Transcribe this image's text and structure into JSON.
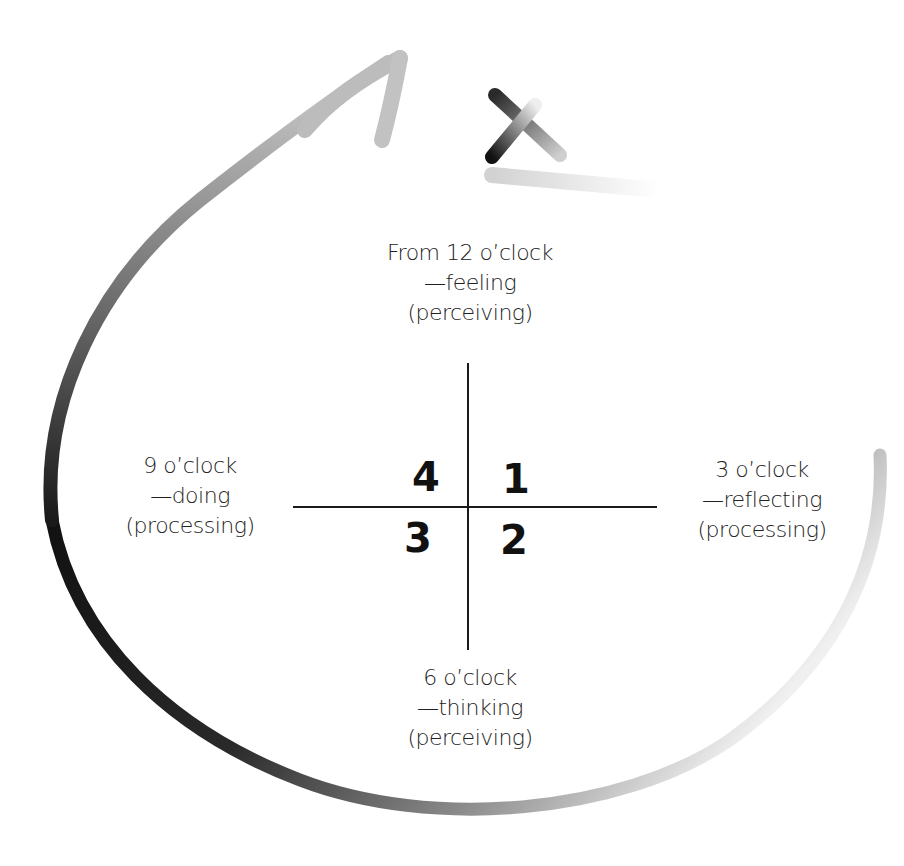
{
  "diagram": {
    "type": "quadrant-cycle",
    "labels": {
      "top": {
        "line1": "From 12 o’clock",
        "line2": "—feeling",
        "line3": "(perceiving)"
      },
      "left": {
        "line1": "9 o’clock",
        "line2": "—doing",
        "line3": "(processing)"
      },
      "right": {
        "line1": "3 o’clock",
        "line2": "—reflecting",
        "line3": "(processing)"
      },
      "bottom": {
        "line1": "6 o’clock",
        "line2": "—thinking",
        "line3": "(perceiving)"
      }
    },
    "quadrants": {
      "top_left": "4",
      "top_right": "1",
      "bottom_right": "2",
      "bottom_left": "3"
    },
    "icons": [
      "loop-arrow-icon",
      "cross-mark-icon"
    ],
    "colors": {
      "stroke_dark": "#111111",
      "stroke_light": "#d8d8d8",
      "text": "#222222"
    }
  }
}
